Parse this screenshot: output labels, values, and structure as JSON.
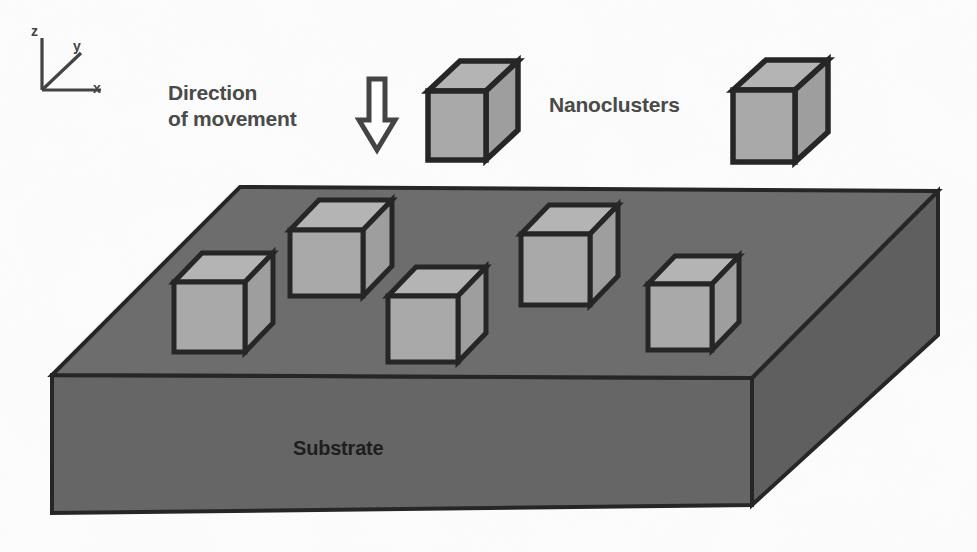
{
  "figure": {
    "background_color": "#fdfdfd"
  },
  "colors": {
    "substrate_top": "#6d6d6d",
    "substrate_front": "#666666",
    "substrate_side": "#5f5f5f",
    "cube_face_front": "#a9a9a9",
    "cube_face_top": "#b4b4b4",
    "cube_face_side": "#9e9e9e",
    "outline": "#262626",
    "label_gray": "#4a4a4a",
    "label_dark": "#1e1e1e",
    "axis": "#434343",
    "arrow_outline": "#444444"
  },
  "labels": {
    "direction": "Direction\nof movement",
    "nanoclusters": "Nanoclusters",
    "substrate": "Substrate"
  },
  "axes": {
    "z": "z",
    "y": "y",
    "x": "x",
    "origin": [
      42,
      90
    ],
    "z_tip": [
      42,
      38
    ],
    "y_tip": [
      80,
      52
    ],
    "x_tip": [
      100,
      90
    ]
  },
  "arrow": {
    "name": "down-arrow",
    "x": 377,
    "y_top": 78,
    "y_bottom": 150,
    "shaft_half_width": 8,
    "head_half_width": 18
  },
  "substrate": {
    "top_face": [
      [
        240,
        187
      ],
      [
        938,
        191
      ],
      [
        752,
        378
      ],
      [
        52,
        375
      ]
    ],
    "front_face": [
      [
        52,
        375
      ],
      [
        752,
        378
      ],
      [
        752,
        505
      ],
      [
        52,
        513
      ]
    ],
    "side_face": [
      [
        752,
        378
      ],
      [
        938,
        191
      ],
      [
        938,
        335
      ],
      [
        752,
        505
      ]
    ],
    "depth": 130
  },
  "cubes_on_substrate": [
    {
      "name": "nanocluster-1",
      "x": 174,
      "y": 282,
      "w": 71,
      "h": 70,
      "dx": 28,
      "dy": -29
    },
    {
      "name": "nanocluster-2",
      "x": 290,
      "y": 230,
      "w": 73,
      "h": 66,
      "dx": 29,
      "dy": -30
    },
    {
      "name": "nanocluster-3",
      "x": 388,
      "y": 296,
      "w": 70,
      "h": 66,
      "dx": 28,
      "dy": -29
    },
    {
      "name": "nanocluster-4",
      "x": 521,
      "y": 234,
      "w": 69,
      "h": 71,
      "dx": 28,
      "dy": -29
    },
    {
      "name": "nanocluster-5",
      "x": 648,
      "y": 284,
      "w": 64,
      "h": 66,
      "dx": 27,
      "dy": -28
    }
  ],
  "cubes_floating": [
    {
      "name": "floating-nanocluster-1",
      "x": 428,
      "y": 91,
      "w": 58,
      "h": 69,
      "dx": 32,
      "dy": -30
    },
    {
      "name": "floating-nanocluster-2",
      "x": 733,
      "y": 90,
      "w": 62,
      "h": 72,
      "dx": 33,
      "dy": -30
    }
  ]
}
